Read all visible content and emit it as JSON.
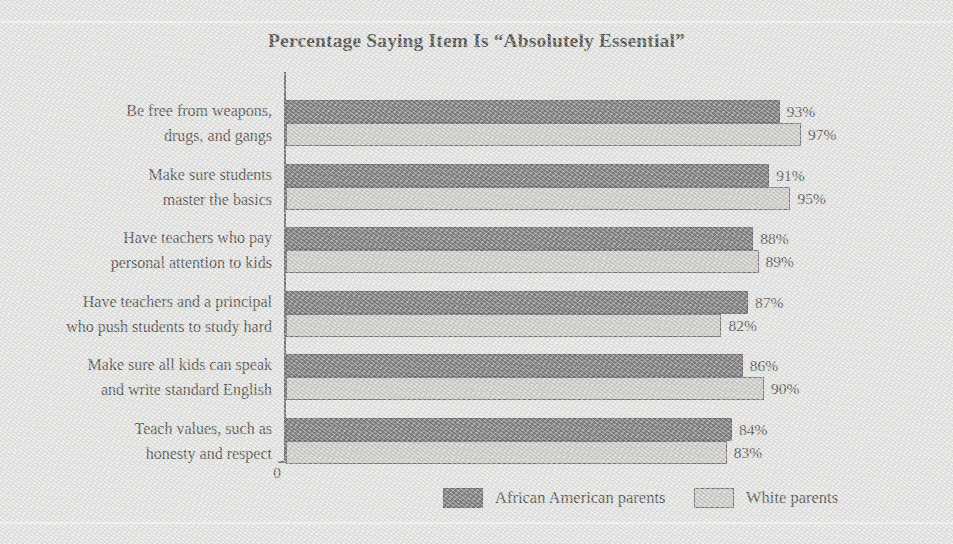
{
  "chart_data": {
    "type": "bar",
    "orientation": "horizontal",
    "title": "Percentage Saying Item Is “Absolutely Essential”",
    "xlabel": "",
    "ylabel": "",
    "axis_origin_label": "0",
    "xlim": [
      0,
      100
    ],
    "grid": false,
    "legend_position": "bottom",
    "value_suffix": "%",
    "categories": [
      "Be free from weapons,\ndrugs, and gangs",
      "Make sure students\nmaster the basics",
      "Have teachers who pay\npersonal attention to kids",
      "Have teachers and a principal\nwho push students to study hard",
      "Make sure all kids can speak\nand write standard English",
      "Teach values, such as\nhonesty and respect"
    ],
    "series": [
      {
        "name": "African American parents",
        "color": "#5b5b5b",
        "values": [
          93,
          91,
          88,
          87,
          86,
          84
        ],
        "labels": [
          "93%",
          "91%",
          "88%",
          "87%",
          "86%",
          "84%"
        ]
      },
      {
        "name": "White parents",
        "color": "#c9c9c7",
        "values": [
          97,
          95,
          89,
          82,
          90,
          83
        ],
        "labels": [
          "97%",
          "95%",
          "89%",
          "82%",
          "90%",
          "83%"
        ]
      }
    ]
  },
  "legend": {
    "items": [
      {
        "label": "African American parents",
        "swatch": "dark-swatch-icon"
      },
      {
        "label": "White parents",
        "swatch": "light-swatch-icon"
      }
    ]
  }
}
